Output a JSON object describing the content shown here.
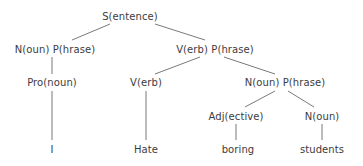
{
  "diagram": {
    "type": "parse-tree",
    "line_color": "#6a6a6a",
    "nodes": [
      {
        "id": "s",
        "label": "S(entence)",
        "x": 130,
        "y": 12
      },
      {
        "id": "np1",
        "label": "N(oun) P(hrase)",
        "x": 55,
        "y": 45
      },
      {
        "id": "vp",
        "label": "V(erb) P(hrase)",
        "x": 215,
        "y": 45
      },
      {
        "id": "pro",
        "label": "Pro(noun)",
        "x": 52,
        "y": 78
      },
      {
        "id": "v",
        "label": "V(erb)",
        "x": 146,
        "y": 78
      },
      {
        "id": "np2",
        "label": "N(oun) P(hrase)",
        "x": 285,
        "y": 78
      },
      {
        "id": "adj",
        "label": "Adj(ective)",
        "x": 236,
        "y": 112
      },
      {
        "id": "n",
        "label": "N(oun)",
        "x": 322,
        "y": 112
      },
      {
        "id": "i",
        "label": "I",
        "x": 52,
        "y": 145
      },
      {
        "id": "hate",
        "label": "Hate",
        "x": 146,
        "y": 145
      },
      {
        "id": "boring",
        "label": "boring",
        "x": 238,
        "y": 145
      },
      {
        "id": "students",
        "label": "students",
        "x": 322,
        "y": 145
      }
    ],
    "edges": [
      {
        "from": "s",
        "to": "np1",
        "x1": 110,
        "y1": 24,
        "x2": 72,
        "y2": 40
      },
      {
        "from": "s",
        "to": "vp",
        "x1": 155,
        "y1": 24,
        "x2": 205,
        "y2": 40
      },
      {
        "from": "np1",
        "to": "pro",
        "x1": 52,
        "y1": 57,
        "x2": 52,
        "y2": 74
      },
      {
        "from": "vp",
        "to": "v",
        "x1": 200,
        "y1": 57,
        "x2": 155,
        "y2": 74
      },
      {
        "from": "vp",
        "to": "np2",
        "x1": 224,
        "y1": 57,
        "x2": 275,
        "y2": 74
      },
      {
        "from": "pro",
        "to": "i",
        "x1": 52,
        "y1": 91,
        "x2": 52,
        "y2": 140
      },
      {
        "from": "v",
        "to": "hate",
        "x1": 146,
        "y1": 91,
        "x2": 146,
        "y2": 140
      },
      {
        "from": "np2",
        "to": "adj",
        "x1": 275,
        "y1": 91,
        "x2": 245,
        "y2": 107
      },
      {
        "from": "np2",
        "to": "n",
        "x1": 288,
        "y1": 91,
        "x2": 314,
        "y2": 107
      },
      {
        "from": "adj",
        "to": "boring",
        "x1": 236,
        "y1": 124,
        "x2": 236,
        "y2": 140
      },
      {
        "from": "n",
        "to": "students",
        "x1": 322,
        "y1": 124,
        "x2": 322,
        "y2": 140
      }
    ]
  }
}
